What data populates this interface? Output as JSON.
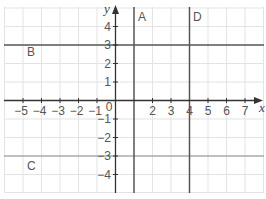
{
  "diagram": {
    "type": "coordinate-grid",
    "axes": {
      "x_label": "x",
      "y_label": "y",
      "x_range": [
        -6,
        8
      ],
      "y_range": [
        -5,
        5
      ]
    },
    "x_ticks": [
      "-5",
      "-4",
      "-3",
      "-2",
      "-1",
      "0",
      "2",
      "3",
      "4",
      "5",
      "6",
      "7"
    ],
    "y_ticks": [
      "4",
      "3",
      "2",
      "1",
      "-1",
      "-2",
      "-3",
      "-4"
    ],
    "lines": [
      {
        "label": "A",
        "equation": "x = 1",
        "orientation": "vertical",
        "value": 1,
        "color": "#555555"
      },
      {
        "label": "D",
        "equation": "x = 4",
        "orientation": "vertical",
        "value": 4,
        "color": "#555555"
      },
      {
        "label": "B",
        "equation": "y = 3",
        "orientation": "horizontal",
        "value": 3,
        "color": "#555555"
      },
      {
        "label": "C",
        "equation": "y = -3",
        "orientation": "horizontal",
        "value": -3,
        "color": "#aaaaaa"
      }
    ],
    "colors": {
      "grid": "#e3e3e3",
      "axis": "#333333",
      "text": "#555555"
    }
  }
}
